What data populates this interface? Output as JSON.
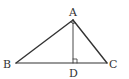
{
  "diagram": {
    "type": "geometry-triangle",
    "stroke_color": "#333333",
    "background": "#ffffff",
    "points": {
      "A": {
        "label": "A",
        "x": 73,
        "y": 20
      },
      "B": {
        "label": "B",
        "x": 16,
        "y": 63
      },
      "C": {
        "label": "C",
        "x": 107,
        "y": 63
      },
      "D": {
        "label": "D",
        "x": 73,
        "y": 63
      }
    },
    "segments": [
      "AB",
      "AC",
      "BC",
      "AD"
    ],
    "right_angles": [
      "BAC",
      "ADC"
    ]
  }
}
